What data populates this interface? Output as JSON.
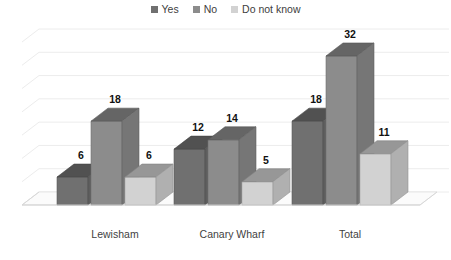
{
  "chart_data": {
    "type": "bar",
    "title": "",
    "subtitle": "",
    "xlabel": "",
    "ylabel": "",
    "categories": [
      "Lewisham",
      "Canary Wharf",
      "Total"
    ],
    "series": [
      {
        "name": "Yes",
        "values": [
          6,
          12,
          18
        ],
        "color": "#707070"
      },
      {
        "name": "No",
        "values": [
          18,
          14,
          32
        ],
        "color": "#8c8c8c"
      },
      {
        "name": "Do not know",
        "values": [
          6,
          5,
          11
        ],
        "color": "#d2d2d2"
      }
    ],
    "ylim": [
      0,
      35
    ],
    "gridlines": true,
    "grid_step": 5,
    "y_tick_labels_visible": false,
    "legend_position": "top-center",
    "three_d": true,
    "data_labels": [
      {
        "series": "Yes",
        "category": "Lewisham",
        "text": "6"
      },
      {
        "series": "No",
        "category": "Lewisham",
        "text": "18"
      },
      {
        "series": "Do not know",
        "category": "Lewisham",
        "text": "6"
      },
      {
        "series": "Yes",
        "category": "Canary Wharf",
        "text": "12"
      },
      {
        "series": "No",
        "category": "Canary Wharf",
        "text": "14"
      },
      {
        "series": "Do not know",
        "category": "Canary Wharf",
        "text": "5"
      },
      {
        "series": "Yes",
        "category": "Total",
        "text": "18"
      },
      {
        "series": "No",
        "category": "Total",
        "text": "32"
      },
      {
        "series": "Do not know",
        "category": "Total",
        "text": "11"
      }
    ]
  },
  "legend": {
    "items": [
      {
        "label": "Yes",
        "color": "#707070"
      },
      {
        "label": "No",
        "color": "#8c8c8c"
      },
      {
        "label": "Do not know",
        "color": "#d2d2d2"
      }
    ]
  },
  "axis": {
    "categories": [
      "Lewisham",
      "Canary Wharf",
      "Total"
    ]
  },
  "colors": {
    "background": "#ffffff",
    "gridline": "#ececec",
    "floor": "#fbfbfb",
    "floor_edge": "#d8d8d8",
    "label_text": "#111111",
    "axis_text": "#3f3f3f"
  }
}
